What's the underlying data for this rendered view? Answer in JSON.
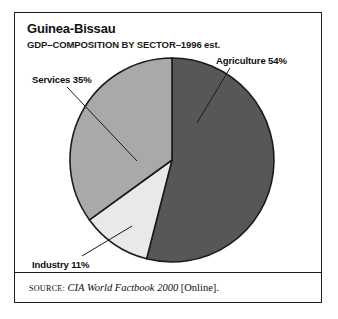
{
  "figure": {
    "title": "Guinea-Bissau",
    "subtitle": "GDP–COMPOSITION BY SECTOR–1996 est."
  },
  "labels": {
    "agriculture": "Agriculture 54%",
    "services": "Services 35%",
    "industry": "Industry 11%"
  },
  "source": {
    "prefix": "SOURCE:",
    "work": "CIA World Factbook 2000",
    "suffix": "[Online]."
  },
  "colors": {
    "agriculture": "#575757",
    "services": "#a9a9a9",
    "industry": "#e9e9e9",
    "outline": "#1c1c1c",
    "frame": "#1c1c1c",
    "text": "#0d0d0d",
    "background": "#ffffff"
  },
  "chart_data": {
    "type": "pie",
    "title": "Guinea-Bissau",
    "subtitle": "GDP–COMPOSITION BY SECTOR–1996 est.",
    "unit": "percent",
    "start_angle_deg": 0,
    "direction": "clockwise",
    "legend": "callout-labels",
    "grid": false,
    "categories": [
      "Agriculture",
      "Industry",
      "Services"
    ],
    "values": [
      54,
      11,
      35
    ],
    "slices": [
      {
        "name": "Agriculture",
        "value": 54,
        "label": "Agriculture 54%",
        "color": "#575757",
        "start_deg": 0,
        "end_deg": 194.4
      },
      {
        "name": "Industry",
        "value": 11,
        "label": "Industry 11%",
        "color": "#e9e9e9",
        "start_deg": 194.4,
        "end_deg": 234.0
      },
      {
        "name": "Services",
        "value": 35,
        "label": "Services 35%",
        "color": "#a9a9a9",
        "start_deg": 234.0,
        "end_deg": 360.0
      }
    ],
    "total": 100,
    "source": "CIA World Factbook 2000 [Online]."
  }
}
